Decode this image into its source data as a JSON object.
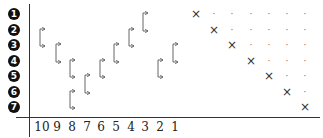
{
  "diagram": {
    "row_labels": [
      "1",
      "2",
      "3",
      "4",
      "5",
      "6",
      "7"
    ],
    "row_label_style": "filled-circle-number",
    "x_axis_labels": [
      "10",
      "9",
      "8",
      "7",
      "6",
      "5",
      "4",
      "3",
      "2",
      "1"
    ],
    "brackets": [
      {
        "column": "10",
        "from_row": 2,
        "to_row": 3
      },
      {
        "column": "9",
        "from_row": 3,
        "to_row": 4
      },
      {
        "column": "8",
        "from_row": 4,
        "to_row": 5
      },
      {
        "column": "8",
        "from_row": 6,
        "to_row": 7
      },
      {
        "column": "7",
        "from_row": 5,
        "to_row": 6
      },
      {
        "column": "6",
        "from_row": 4,
        "to_row": 5
      },
      {
        "column": "5",
        "from_row": 3,
        "to_row": 4
      },
      {
        "column": "4",
        "from_row": 2,
        "to_row": 3
      },
      {
        "column": "3",
        "from_row": 1,
        "to_row": 2
      },
      {
        "column": "2",
        "from_row": 4,
        "to_row": 5
      },
      {
        "column": "1",
        "from_row": 3,
        "to_row": 4
      }
    ],
    "grid": {
      "size": 7,
      "diagonal_marker": "×",
      "upper_marker": "·",
      "description": "Row i has × in column i and · in columns i+1..7"
    },
    "colors": {
      "ink": "#1a1a1a",
      "bracket": "#555555",
      "background": "#ffffff"
    }
  }
}
